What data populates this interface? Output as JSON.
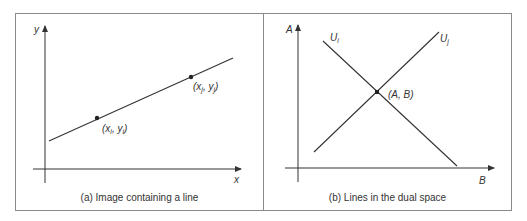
{
  "figure": {
    "panels": [
      {
        "id": "a",
        "caption": "(a) Image containing a line",
        "axes": {
          "x_label": "x",
          "y_label": "y"
        },
        "points": [
          {
            "label_html": "(x_i, y_i)",
            "x_sub": "i",
            "y_sub": "i"
          },
          {
            "label_html": "(x_j, y_j)",
            "x_sub": "j",
            "y_sub": "j"
          }
        ]
      },
      {
        "id": "b",
        "caption": "(b) Lines in the dual space",
        "axes": {
          "x_label": "B",
          "y_label": "A"
        },
        "lines": [
          {
            "label": "U",
            "sub": "i"
          },
          {
            "label": "U",
            "sub": "j"
          }
        ],
        "intersection_label": "(A, B)"
      }
    ],
    "colors": {
      "stroke": "#333333",
      "border": "#8a8a8a",
      "text": "#333333"
    }
  }
}
